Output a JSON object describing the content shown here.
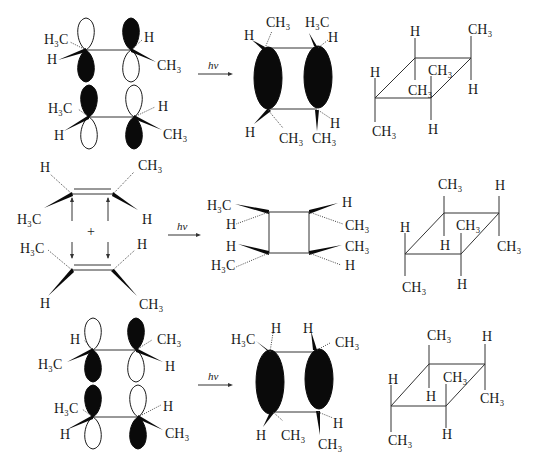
{
  "figure": {
    "reaction_condition": "hv",
    "rows": [
      {
        "id": "row1",
        "reactants": {
          "top_alkene": {
            "left_substituents": [
              "H3C",
              "H"
            ],
            "right_substituents": [
              "H",
              "CH3"
            ]
          },
          "bottom_alkene": {
            "left_substituents": [
              "H3C",
              "H"
            ],
            "right_substituents": [
              "H",
              "CH3"
            ]
          }
        },
        "product_orbital_view": {
          "labels_top": [
            "H",
            "CH3",
            "H3C",
            "H"
          ],
          "labels_bottom": [
            "H",
            "CH3",
            "CH3",
            "H"
          ]
        },
        "product_perspective": {
          "labels": [
            "H",
            "CH3",
            "H",
            "CH3",
            "CH3",
            "H",
            "CH3",
            "H"
          ]
        }
      },
      {
        "id": "row2",
        "reactants": {
          "top_alkene": {
            "left_substituents": [
              "H",
              "H3C"
            ],
            "right_substituents": [
              "CH3",
              "H"
            ]
          },
          "bottom_alkene": {
            "left_substituents": [
              "H3C",
              "H"
            ],
            "right_substituents": [
              "H",
              "CH3"
            ]
          },
          "plus": "+"
        },
        "product_square": {
          "left_labels": [
            "H3C",
            "H",
            "H",
            "H3C"
          ],
          "right_labels": [
            "H",
            "CH3",
            "CH3",
            "H"
          ]
        },
        "product_perspective": {
          "labels": [
            "CH3",
            "H",
            "H",
            "CH3",
            "H",
            "CH3",
            "CH3",
            "H"
          ]
        }
      },
      {
        "id": "row3",
        "reactants": {
          "top_alkene": {
            "left_substituents": [
              "H",
              "H3C"
            ],
            "right_substituents": [
              "CH3",
              "H"
            ]
          },
          "bottom_alkene": {
            "left_substituents": [
              "H3C",
              "H"
            ],
            "right_substituents": [
              "H",
              "CH3"
            ]
          }
        },
        "product_orbital_view": {
          "labels_top": [
            "H3C",
            "H",
            "H",
            "CH3"
          ],
          "labels_bottom": [
            "H",
            "CH3",
            "H",
            "CH3"
          ]
        },
        "product_perspective": {
          "labels": [
            "CH3",
            "H",
            "H",
            "CH3",
            "H",
            "CH3",
            "CH3",
            "H"
          ]
        }
      }
    ]
  },
  "labels": {
    "hv": "hv",
    "plus": "+",
    "H": "H",
    "CH3": "CH₃",
    "H3C": "H₃C"
  }
}
